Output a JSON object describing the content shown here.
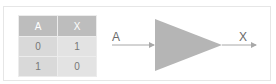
{
  "truth_table": {
    "headers": [
      "A",
      "X"
    ],
    "rows": [
      [
        "0",
        "1"
      ],
      [
        "1",
        "0"
      ]
    ]
  },
  "gate": {
    "type": "buffer-triangle",
    "input_label": "A",
    "output_label": "X",
    "fill_color": "#b5b5b5",
    "wire_color": "#a8a8a8"
  }
}
